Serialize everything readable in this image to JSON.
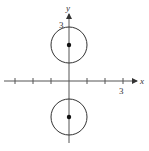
{
  "chart_data": {
    "type": "scatter",
    "title": "",
    "xlabel": "x",
    "ylabel": "y",
    "xlim": [
      -3.6,
      3.6
    ],
    "ylim": [
      -3.4,
      4.4
    ],
    "grid": false,
    "tick_labels": {
      "x": [
        "3"
      ],
      "y": [
        "3"
      ]
    },
    "x_ticks": [
      -3,
      -2,
      -1,
      1,
      2,
      3
    ],
    "points": [
      {
        "x": 0,
        "y": 2
      },
      {
        "x": 0,
        "y": -2
      }
    ],
    "circles": [
      {
        "cx": 0,
        "cy": 2,
        "r": 1
      },
      {
        "cx": 0,
        "cy": -2,
        "r": 1
      }
    ],
    "colors": {
      "axis": "#555555",
      "curve": "#333333",
      "point": "#111111"
    }
  },
  "labels": {
    "x_axis": "x",
    "y_axis": "y",
    "x_tick_3": "3",
    "y_tick_3": "3"
  }
}
